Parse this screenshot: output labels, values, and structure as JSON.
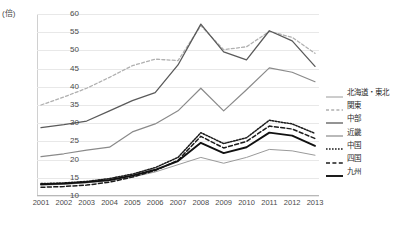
{
  "chart_data": {
    "type": "line",
    "title": "",
    "xlabel": "",
    "ylabel": "(倍)",
    "y_unit": "(倍)",
    "ylim": [
      10,
      60
    ],
    "ytick_step": 5,
    "grid": true,
    "legend_position": "right",
    "categories": [
      "2001",
      "2002",
      "2003",
      "2004",
      "2005",
      "2006",
      "2007",
      "2008",
      "2009",
      "2010",
      "2011",
      "2012",
      "2013"
    ],
    "yticks": [
      "60",
      "55",
      "50",
      "45",
      "40",
      "35",
      "30",
      "25",
      "20",
      "15",
      "10"
    ],
    "series": [
      {
        "name": "北海道・東北",
        "style": "solid-thin-gray",
        "color": "#9a9a9a",
        "values": [
          13.0,
          13.2,
          13.6,
          14.2,
          15.2,
          16.6,
          18.6,
          20.6,
          19.0,
          20.6,
          22.8,
          22.4,
          21.2
        ]
      },
      {
        "name": "関東",
        "style": "dotted-light",
        "color": "#b0b0b0",
        "values": [
          35.0,
          37.2,
          39.6,
          42.6,
          45.8,
          47.6,
          47.2,
          56.8,
          50.2,
          51.0,
          55.2,
          53.6,
          49.2
        ]
      },
      {
        "name": "中部",
        "style": "solid-dark",
        "color": "#5a5a5a",
        "values": [
          28.8,
          29.6,
          30.6,
          33.4,
          36.2,
          38.4,
          46.0,
          57.2,
          49.6,
          47.4,
          55.4,
          52.6,
          45.6
        ]
      },
      {
        "name": "近畿",
        "style": "solid-gray",
        "color": "#8a8a8a",
        "values": [
          20.8,
          21.6,
          22.6,
          23.4,
          27.6,
          29.8,
          33.4,
          39.6,
          33.4,
          39.2,
          45.2,
          44.0,
          41.4
        ]
      },
      {
        "name": "中国",
        "style": "fine-dotted",
        "color": "#1c1c1c",
        "values": [
          13.4,
          13.6,
          14.0,
          14.8,
          16.0,
          17.8,
          20.6,
          27.4,
          24.4,
          26.0,
          30.8,
          29.8,
          27.2
        ]
      },
      {
        "name": "四国",
        "style": "dashed",
        "color": "#1c1c1c",
        "values": [
          12.4,
          12.6,
          13.0,
          13.8,
          15.2,
          17.0,
          19.8,
          26.4,
          23.2,
          25.0,
          29.2,
          28.4,
          25.8
        ]
      },
      {
        "name": "九州",
        "style": "solid-bold-black",
        "color": "#111111",
        "values": [
          13.2,
          13.4,
          13.8,
          14.4,
          15.6,
          17.2,
          19.6,
          24.6,
          21.8,
          23.4,
          27.4,
          26.6,
          23.8
        ]
      }
    ]
  }
}
